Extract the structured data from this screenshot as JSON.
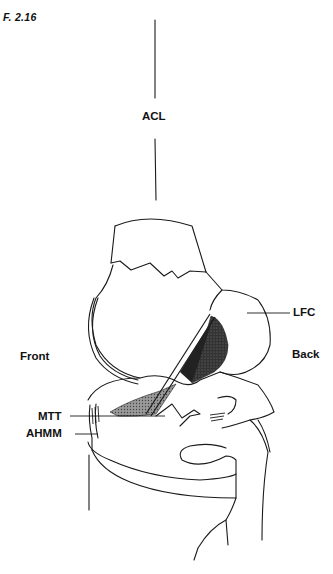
{
  "figure": {
    "number": "F. 2.16"
  },
  "labels": {
    "acl": "ACL",
    "lfc": "LFC",
    "front": "Front",
    "back": "Back",
    "mtt": "MTT",
    "ahmm": "AHMM"
  },
  "colors": {
    "line": "#1a1a1a",
    "shade_dark": "#2a2a2a",
    "shade_mid": "#8a8a8a",
    "background": "#ffffff"
  }
}
